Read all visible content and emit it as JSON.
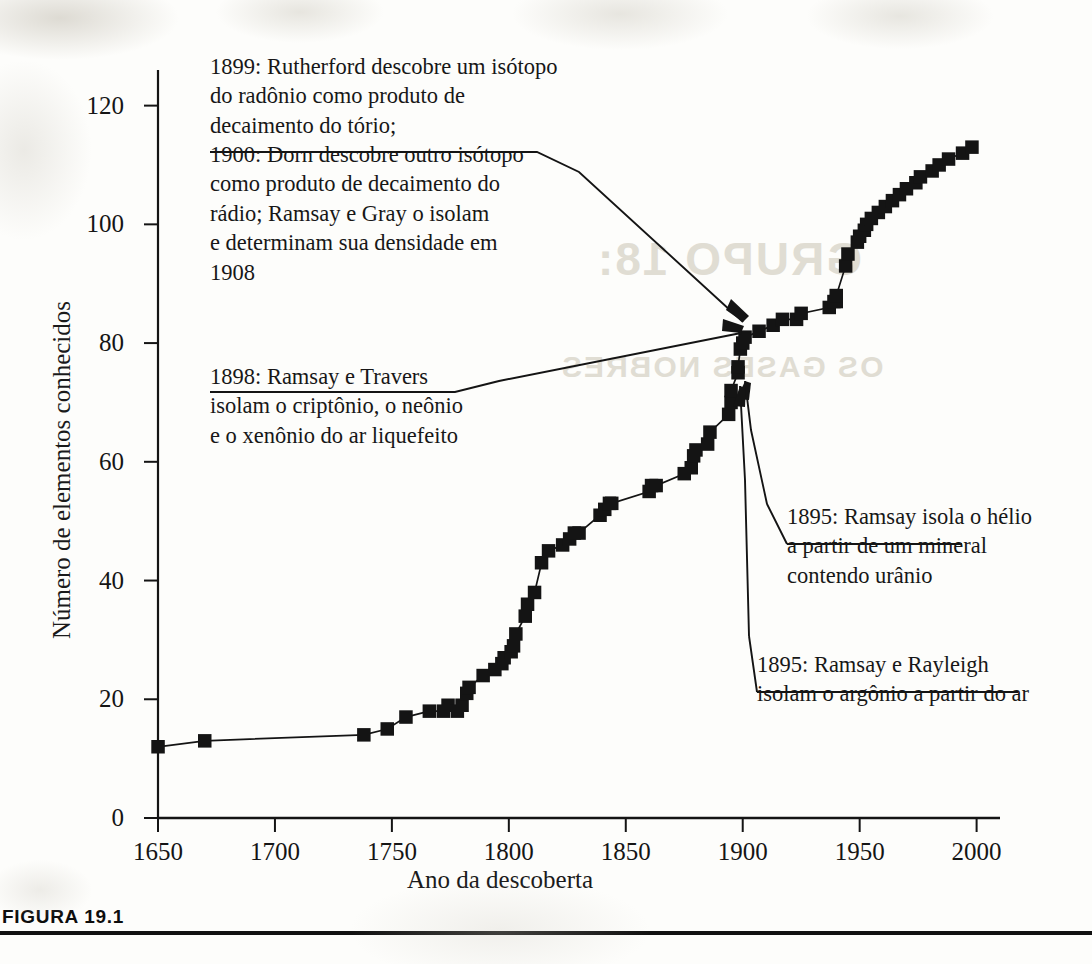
{
  "figure": {
    "caption_label": "FIGURA 19.1"
  },
  "chart_data": {
    "type": "line",
    "title": "",
    "subtitle": "",
    "xlabel": "Ano da descoberta",
    "ylabel": "Número de elementos conhecidos",
    "xlim": [
      1650,
      2010
    ],
    "ylim": [
      0,
      126
    ],
    "xticks": [
      1650,
      1700,
      1750,
      1800,
      1850,
      1900,
      1950,
      2000
    ],
    "yticks": [
      0,
      20,
      40,
      60,
      80,
      100,
      120
    ],
    "grid": false,
    "legend": null,
    "marker": "filled-square",
    "series": [
      {
        "name": "Elementos conhecidos",
        "points": [
          [
            1650,
            12
          ],
          [
            1670,
            13
          ],
          [
            1738,
            14
          ],
          [
            1748,
            15
          ],
          [
            1756,
            17
          ],
          [
            1766,
            18
          ],
          [
            1772,
            18
          ],
          [
            1774,
            19
          ],
          [
            1778,
            18
          ],
          [
            1780,
            19
          ],
          [
            1782,
            21
          ],
          [
            1783,
            22
          ],
          [
            1789,
            24
          ],
          [
            1794,
            25
          ],
          [
            1797,
            26
          ],
          [
            1798,
            27
          ],
          [
            1801,
            28
          ],
          [
            1802,
            29
          ],
          [
            1803,
            31
          ],
          [
            1807,
            34
          ],
          [
            1808,
            36
          ],
          [
            1811,
            38
          ],
          [
            1814,
            43
          ],
          [
            1817,
            45
          ],
          [
            1823,
            46
          ],
          [
            1826,
            47
          ],
          [
            1828,
            48
          ],
          [
            1830,
            48
          ],
          [
            1839,
            51
          ],
          [
            1841,
            52
          ],
          [
            1843,
            53
          ],
          [
            1844,
            53
          ],
          [
            1860,
            55
          ],
          [
            1861,
            56
          ],
          [
            1863,
            56
          ],
          [
            1875,
            58
          ],
          [
            1878,
            59
          ],
          [
            1879,
            61
          ],
          [
            1880,
            62
          ],
          [
            1885,
            63
          ],
          [
            1886,
            65
          ],
          [
            1894,
            68
          ],
          [
            1895,
            70
          ],
          [
            1895,
            72
          ],
          [
            1898,
            75
          ],
          [
            1898,
            76
          ],
          [
            1899,
            79
          ],
          [
            1900,
            80
          ],
          [
            1901,
            81
          ],
          [
            1907,
            82
          ],
          [
            1913,
            83
          ],
          [
            1917,
            84
          ],
          [
            1923,
            84
          ],
          [
            1925,
            85
          ],
          [
            1937,
            86
          ],
          [
            1939,
            87
          ],
          [
            1940,
            87
          ],
          [
            1940,
            88
          ],
          [
            1944,
            93
          ],
          [
            1945,
            95
          ],
          [
            1949,
            97
          ],
          [
            1950,
            98
          ],
          [
            1952,
            99
          ],
          [
            1953,
            100
          ],
          [
            1955,
            101
          ],
          [
            1958,
            102
          ],
          [
            1961,
            103
          ],
          [
            1964,
            104
          ],
          [
            1967,
            105
          ],
          [
            1970,
            106
          ],
          [
            1974,
            107
          ],
          [
            1976,
            108
          ],
          [
            1981,
            109
          ],
          [
            1984,
            110
          ],
          [
            1988,
            111
          ],
          [
            1994,
            112
          ],
          [
            1998,
            113
          ]
        ]
      }
    ],
    "annotations": [
      {
        "id": "rutherford",
        "lines": [
          "1899: Rutherford descobre um isótopo",
          "do radônio como produto de",
          "decaimento do tório;",
          "1900: Dorn descobre outro isótopo",
          "como produto de decaimento do",
          "rádio; Ramsay e Gray o isolam",
          "e determinam sua densidade em",
          "1908"
        ],
        "points_to_year": 1901,
        "points_to_value": 81
      },
      {
        "id": "travers",
        "lines": [
          "1898: Ramsay e Travers",
          "isolam o criptônio, o neônio",
          "e o xenônio do ar liquefeito"
        ],
        "points_to_year": 1899,
        "points_to_value": 79
      },
      {
        "id": "helio",
        "lines": [
          "1895: Ramsay isola o hélio",
          "a partir de um mineral",
          "contendo urânio"
        ],
        "points_to_year": 1895,
        "points_to_value": 72
      },
      {
        "id": "argonio",
        "lines": [
          "1895: Ramsay e Rayleigh",
          "isolam o argônio a partir do ar"
        ],
        "points_to_year": 1895,
        "points_to_value": 71
      }
    ]
  },
  "ghost_text": {
    "line1": "GRUPO 18:",
    "line2": "OS GASES NOBRES"
  },
  "colors": {
    "ink": "#141414",
    "paper": "#fdfdfb",
    "ghost": "#cfcabb"
  }
}
